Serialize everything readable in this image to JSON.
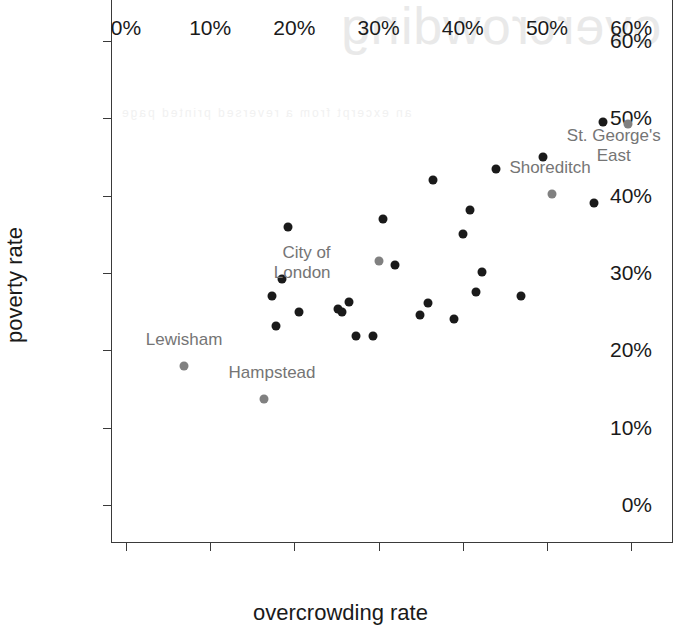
{
  "chart_data": {
    "type": "scatter",
    "title": "",
    "xlabel": "overcrowding rate",
    "ylabel": "poverty rate",
    "xlim": [
      -1.66,
      64.85
    ],
    "ylim": [
      -4.77,
      65.3
    ],
    "xticks": [
      0,
      10,
      20,
      30,
      40,
      50,
      60
    ],
    "xticklabels": [
      "0%",
      "10%",
      "20%",
      "30%",
      "40%",
      "50%",
      "60%"
    ],
    "yticks": [
      0,
      10,
      20,
      30,
      40,
      50,
      60
    ],
    "yticklabels": [
      "0%",
      "10%",
      "20%",
      "30%",
      "40%",
      "50%",
      "60%"
    ],
    "grid": false,
    "legend": null,
    "marker_colors": {
      "default": "#1a1a1a",
      "highlight": "#808080"
    },
    "points": [
      {
        "x": 6.9,
        "y": 18.0,
        "color": "#808080",
        "label": "Lewisham"
      },
      {
        "x": 16.4,
        "y": 13.7,
        "color": "#808080",
        "label": "Hampstead"
      },
      {
        "x": 19.3,
        "y": 36.0,
        "color": "#1a1a1a",
        "label": ""
      },
      {
        "x": 18.5,
        "y": 29.2,
        "color": "#1a1a1a",
        "label": ""
      },
      {
        "x": 17.4,
        "y": 27.0,
        "color": "#1a1a1a",
        "label": ""
      },
      {
        "x": 17.8,
        "y": 23.2,
        "color": "#1a1a1a",
        "label": ""
      },
      {
        "x": 20.5,
        "y": 25.0,
        "color": "#1a1a1a",
        "label": ""
      },
      {
        "x": 25.2,
        "y": 25.3,
        "color": "#1a1a1a",
        "label": ""
      },
      {
        "x": 26.5,
        "y": 26.2,
        "color": "#1a1a1a",
        "label": ""
      },
      {
        "x": 25.7,
        "y": 24.9,
        "color": "#1a1a1a",
        "label": ""
      },
      {
        "x": 27.3,
        "y": 21.8,
        "color": "#1a1a1a",
        "label": ""
      },
      {
        "x": 29.3,
        "y": 21.8,
        "color": "#1a1a1a",
        "label": ""
      },
      {
        "x": 30.5,
        "y": 37.0,
        "color": "#1a1a1a",
        "label": ""
      },
      {
        "x": 30.0,
        "y": 31.5,
        "color": "#808080",
        "label": "City of London"
      },
      {
        "x": 32.0,
        "y": 31.0,
        "color": "#1a1a1a",
        "label": ""
      },
      {
        "x": 34.9,
        "y": 24.6,
        "color": "#1a1a1a",
        "label": ""
      },
      {
        "x": 36.5,
        "y": 42.0,
        "color": "#1a1a1a",
        "label": ""
      },
      {
        "x": 35.9,
        "y": 26.1,
        "color": "#1a1a1a",
        "label": ""
      },
      {
        "x": 38.9,
        "y": 24.0,
        "color": "#1a1a1a",
        "label": ""
      },
      {
        "x": 40.0,
        "y": 35.0,
        "color": "#1a1a1a",
        "label": ""
      },
      {
        "x": 40.8,
        "y": 38.1,
        "color": "#1a1a1a",
        "label": ""
      },
      {
        "x": 42.3,
        "y": 30.2,
        "color": "#1a1a1a",
        "label": ""
      },
      {
        "x": 41.6,
        "y": 27.6,
        "color": "#1a1a1a",
        "label": ""
      },
      {
        "x": 44.0,
        "y": 43.5,
        "color": "#1a1a1a",
        "label": ""
      },
      {
        "x": 46.9,
        "y": 27.0,
        "color": "#1a1a1a",
        "label": ""
      },
      {
        "x": 49.5,
        "y": 45.0,
        "color": "#1a1a1a",
        "label": ""
      },
      {
        "x": 50.6,
        "y": 40.2,
        "color": "#808080",
        "label": "Shoreditch"
      },
      {
        "x": 55.6,
        "y": 39.1,
        "color": "#1a1a1a",
        "label": ""
      },
      {
        "x": 56.6,
        "y": 49.5,
        "color": "#1a1a1a",
        "label": ""
      },
      {
        "x": 59.6,
        "y": 49.3,
        "color": "#808080",
        "label": "St. George's East"
      }
    ],
    "annotations": [
      {
        "text": "Lewisham",
        "x": 6.9,
        "y": 18.0,
        "dx": 0,
        "dy": -26,
        "align": "center"
      },
      {
        "text": "Hampstead",
        "x": 16.4,
        "y": 13.7,
        "dx": 8,
        "dy": -26,
        "align": "center"
      },
      {
        "text": "City of\nLondon",
        "x": 30.0,
        "y": 31.5,
        "dx": -48,
        "dy": 2,
        "align": "right"
      },
      {
        "text": "Shoreditch",
        "x": 50.6,
        "y": 40.2,
        "dx": -2,
        "dy": -26,
        "align": "center"
      },
      {
        "text": "St. George's\nEast",
        "x": 59.6,
        "y": 49.3,
        "dx": -14,
        "dy": 22,
        "align": "center"
      }
    ]
  },
  "bleed_through": {
    "title": "overcrowding",
    "line": "an excerpt from a reversed printed page",
    "block": "table of figures continued"
  }
}
